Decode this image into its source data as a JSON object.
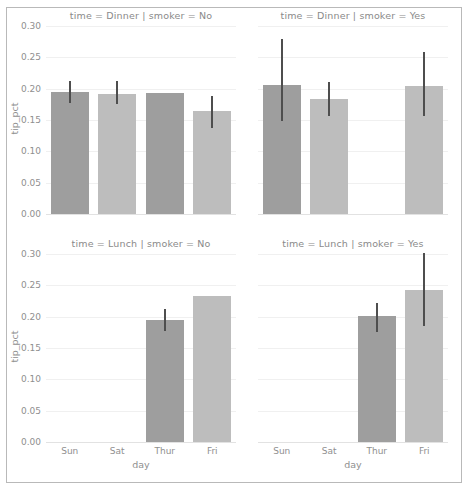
{
  "figure": {
    "width": 469,
    "height": 490,
    "background": "#ffffff",
    "border_color": "#b9b9b9"
  },
  "style": {
    "bar_color_dark": "#9e9e9e",
    "bar_color_light": "#bdbdbd",
    "errorbar_color": "#4e4e4e",
    "grid_color": "#f0f0f0",
    "text_color": "#8f8f8f"
  },
  "axis": {
    "ylabel": "tip_pct",
    "xlabel": "day",
    "ytick_labels": [
      "0.00",
      "0.05",
      "0.10",
      "0.15",
      "0.20",
      "0.25",
      "0.30"
    ],
    "ytick_values": [
      0.0,
      0.05,
      0.1,
      0.15,
      0.2,
      0.25,
      0.3
    ],
    "xtick_labels": [
      "Sun",
      "Sat",
      "Thur",
      "Fri"
    ],
    "ylim": [
      0.0,
      0.3
    ]
  },
  "chart_data": {
    "type": "bar",
    "title": "",
    "xlabel": "day",
    "ylabel": "tip_pct",
    "ylim": [
      0.0,
      0.3
    ],
    "grid": true,
    "legend": "none",
    "categories": [
      "Sun",
      "Sat",
      "Thur",
      "Fri"
    ],
    "facet_rows": [
      "Dinner",
      "Lunch"
    ],
    "facet_cols": [
      "No",
      "Yes"
    ],
    "facets": [
      {
        "id": "dinner-no",
        "row": 0,
        "col": 0,
        "title": "time = Dinner | smoker = No",
        "time": "Dinner",
        "smoker": "No",
        "categories": [
          "Sun",
          "Sat",
          "Thur",
          "Fri"
        ],
        "values": [
          0.195,
          0.192,
          0.193,
          0.165
        ],
        "ci_low": [
          0.177,
          0.175,
          null,
          0.138
        ],
        "ci_high": [
          0.212,
          0.212,
          null,
          0.188
        ]
      },
      {
        "id": "dinner-yes",
        "row": 0,
        "col": 1,
        "title": "time = Dinner | smoker = Yes",
        "time": "Dinner",
        "smoker": "Yes",
        "categories": [
          "Sun",
          "Sat",
          "Thur",
          "Fri"
        ],
        "values": [
          0.206,
          0.183,
          null,
          0.205
        ],
        "ci_low": [
          0.148,
          0.157,
          null,
          0.157
        ],
        "ci_high": [
          0.28,
          0.21,
          null,
          0.258
        ]
      },
      {
        "id": "lunch-no",
        "row": 1,
        "col": 0,
        "title": "time = Lunch | smoker = No",
        "time": "Lunch",
        "smoker": "No",
        "categories": [
          "Sun",
          "Sat",
          "Thur",
          "Fri"
        ],
        "values": [
          null,
          null,
          0.194,
          0.233
        ],
        "ci_low": [
          null,
          null,
          0.177,
          null
        ],
        "ci_high": [
          null,
          null,
          0.213,
          null
        ]
      },
      {
        "id": "lunch-yes",
        "row": 1,
        "col": 1,
        "title": "time = Lunch | smoker = Yes",
        "time": "Lunch",
        "smoker": "Yes",
        "categories": [
          "Sun",
          "Sat",
          "Thur",
          "Fri"
        ],
        "values": [
          null,
          null,
          0.201,
          0.242
        ],
        "ci_low": [
          null,
          null,
          0.176,
          0.185
        ],
        "ci_high": [
          null,
          null,
          0.222,
          0.302
        ]
      }
    ]
  }
}
